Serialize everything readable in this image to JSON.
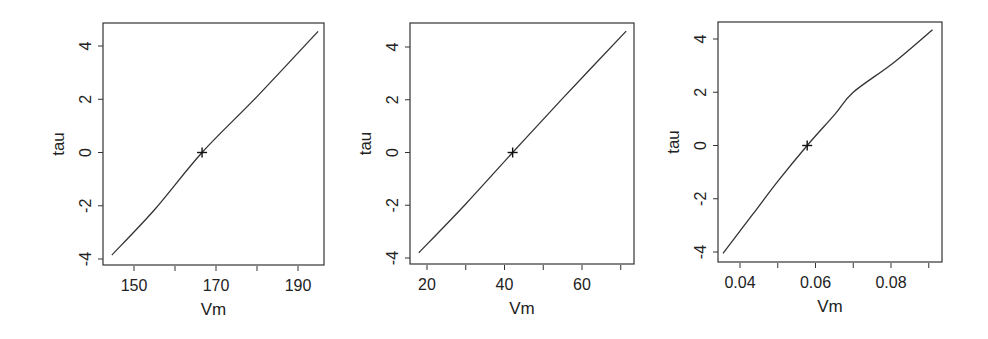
{
  "chart_data": [
    {
      "type": "line",
      "title": "",
      "xlabel": "Vm",
      "ylabel": "tau",
      "xlim": [
        143,
        196
      ],
      "ylim": [
        -4.2,
        4.9
      ],
      "x_ticks": [
        150,
        160,
        170,
        180,
        190
      ],
      "x_tick_labels": [
        "150",
        "",
        "170",
        "",
        "190"
      ],
      "y_ticks": [
        -4,
        -2,
        0,
        2,
        4
      ],
      "y_tick_labels": [
        "-4",
        "-2",
        "0",
        "2",
        "4"
      ],
      "grid": false,
      "series": [
        {
          "name": "profile",
          "x": [
            144.6,
            155,
            166.6,
            180,
            194.9
          ],
          "y": [
            -3.85,
            -2.15,
            0,
            2.1,
            4.55
          ]
        }
      ],
      "marker": {
        "symbol": "+",
        "x": 166.6,
        "y": 0
      },
      "box": {
        "left": 103,
        "top": 23,
        "right": 324,
        "bottom": 265
      },
      "x_px": {
        "v0": 150,
        "p0": 134,
        "v1": 190,
        "p1": 298
      },
      "y_px": {
        "v0": -4,
        "p0": 259,
        "v1": 4,
        "p1": 46
      }
    },
    {
      "type": "line",
      "title": "",
      "xlabel": "Vm",
      "ylabel": "tau",
      "xlim": [
        15,
        73
      ],
      "ylim": [
        -4.2,
        4.9
      ],
      "x_ticks": [
        20,
        30,
        40,
        50,
        60,
        70
      ],
      "x_tick_labels": [
        "20",
        "",
        "40",
        "",
        "60",
        ""
      ],
      "y_ticks": [
        -4,
        -2,
        0,
        2,
        4
      ],
      "y_tick_labels": [
        "-4",
        "-2",
        "0",
        "2",
        "4"
      ],
      "grid": false,
      "series": [
        {
          "name": "profile",
          "x": [
            17.9,
            30,
            42.1,
            55,
            71.4
          ],
          "y": [
            -3.8,
            -1.95,
            0,
            2.05,
            4.6
          ]
        }
      ],
      "marker": {
        "symbol": "+",
        "x": 42.1,
        "y": 0
      },
      "box": {
        "left": 410,
        "top": 23,
        "right": 634,
        "bottom": 264
      },
      "x_px": {
        "v0": 20,
        "p0": 427,
        "v1": 60,
        "p1": 582
      },
      "y_px": {
        "v0": -4,
        "p0": 258,
        "v1": 4,
        "p1": 47
      }
    },
    {
      "type": "line",
      "title": "",
      "xlabel": "Vm",
      "ylabel": "tau",
      "xlim": [
        0.034,
        0.093
      ],
      "ylim": [
        -4.3,
        4.8
      ],
      "x_ticks": [
        0.04,
        0.05,
        0.06,
        0.07,
        0.08,
        0.09
      ],
      "x_tick_labels": [
        "0.04",
        "",
        "0.06",
        "",
        "0.08",
        ""
      ],
      "y_ticks": [
        -4,
        -2,
        0,
        2,
        4
      ],
      "y_tick_labels": [
        "-4",
        "-2",
        "0",
        "2",
        "4"
      ],
      "grid": false,
      "series": [
        {
          "name": "profile",
          "x": [
            0.0355,
            0.0433,
            0.05,
            0.0578,
            0.065,
            0.07,
            0.0806,
            0.091
          ],
          "y": [
            -4.05,
            -2.6,
            -1.35,
            0,
            1.15,
            2.0,
            3.1,
            4.35
          ]
        }
      ],
      "marker": {
        "symbol": "+",
        "x": 0.0578,
        "y": 0
      },
      "box": {
        "left": 718,
        "top": 22,
        "right": 942,
        "bottom": 262
      },
      "x_px": {
        "v0": 0.04,
        "p0": 740,
        "v1": 0.08,
        "p1": 891
      },
      "y_px": {
        "v0": -4,
        "p0": 252,
        "v1": 4,
        "p1": 39
      }
    }
  ],
  "style": {
    "line_color": "#333333",
    "axis_color": "#333333",
    "text_color": "#222222"
  }
}
